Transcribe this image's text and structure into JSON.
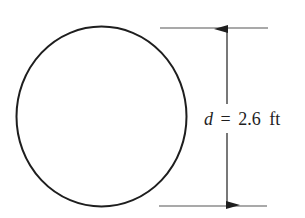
{
  "figure": {
    "shape": "circle",
    "dimension": {
      "variable": "d",
      "equals": "=",
      "value": "2.6",
      "unit": "ft",
      "full_label": "d = 2.6 ft"
    },
    "colors": {
      "stroke": "#1e1e1e",
      "extension_line": "#555555",
      "background": "#ffffff"
    }
  }
}
